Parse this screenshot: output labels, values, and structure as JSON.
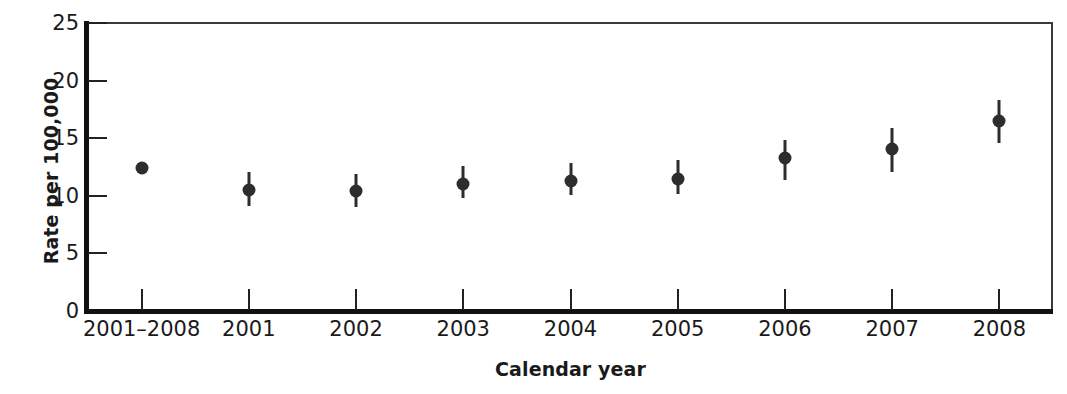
{
  "chart_data": {
    "type": "scatter",
    "title": "",
    "xlabel": "Calendar year",
    "ylabel": "Rate per 100,000",
    "categories": [
      "2001–2008",
      "2001",
      "2002",
      "2003",
      "2004",
      "2005",
      "2006",
      "2007",
      "2008"
    ],
    "values": [
      12.3,
      10.4,
      10.3,
      10.9,
      11.2,
      11.4,
      13.2,
      14.0,
      16.4
    ],
    "error_low": [
      11.9,
      9.0,
      8.9,
      9.7,
      10.0,
      10.1,
      11.3,
      12.0,
      14.5
    ],
    "error_high": [
      12.7,
      12.0,
      11.8,
      12.5,
      12.8,
      13.0,
      14.8,
      15.8,
      18.2
    ],
    "ylim": [
      0,
      25
    ],
    "yticks": [
      0,
      5,
      10,
      15,
      20,
      25
    ],
    "ytick_labels": [
      "0",
      "5",
      "10",
      "15",
      "20",
      "25"
    ],
    "grid": false,
    "legend": "none",
    "marker_color": "#2d2d2d",
    "axis_color": "#111111"
  }
}
